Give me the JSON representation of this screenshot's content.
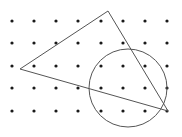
{
  "figure": {
    "background": "#ffffff",
    "dot_color": "#1a1a1a",
    "line_color": "#555555",
    "grid": {
      "columns_x": [
        12,
        34,
        56,
        78,
        101,
        123,
        145,
        167
      ],
      "rows_y": [
        21,
        43,
        66,
        88,
        111
      ],
      "dot_radius": 1.6
    },
    "triangle": {
      "points": [
        [
          20,
          69
        ],
        [
          108,
          11
        ],
        [
          168,
          111
        ]
      ]
    },
    "circle": {
      "cx": 128,
      "cy": 88,
      "r": 39
    }
  }
}
